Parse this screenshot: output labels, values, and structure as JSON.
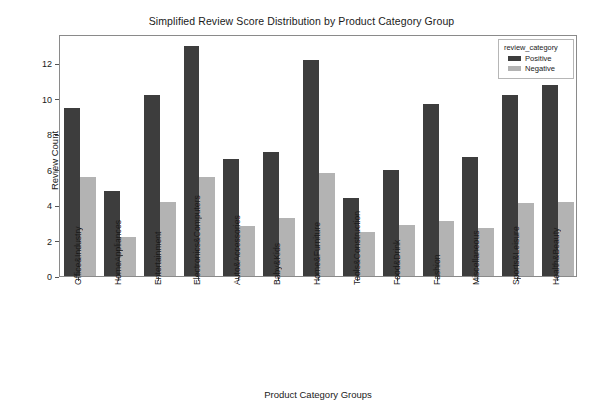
{
  "chart_data": {
    "type": "bar",
    "title": "Simplified Review Score Distribution by Product Category Group",
    "xlabel": "Product Category Groups",
    "ylabel": "Review Count",
    "categories": [
      "Office&Industry",
      "HomeAppliances",
      "Entertainment",
      "Electronics&Computers",
      "Auto&Accessories",
      "Baby&Kids",
      "Home&Furniture",
      "Tools&Construction",
      "Food&Drink",
      "Fashion",
      "Miscellaneous",
      "Sports&Leisure",
      "Health&Beauty"
    ],
    "series": [
      {
        "name": "Positive",
        "color": "#3d3d3d",
        "values": [
          9.5,
          4.8,
          10.2,
          13.0,
          6.6,
          7.0,
          12.2,
          4.4,
          6.0,
          9.7,
          6.7,
          10.2,
          10.8
        ]
      },
      {
        "name": "Negative",
        "color": "#b3b3b3",
        "values": [
          5.6,
          2.2,
          4.2,
          5.6,
          2.8,
          3.3,
          5.8,
          2.5,
          2.9,
          3.1,
          2.7,
          4.1,
          4.2
        ]
      }
    ],
    "ylim": [
      0,
      13.65
    ],
    "yticks": [
      0,
      2,
      4,
      6,
      8,
      10,
      12
    ],
    "ytick_labels": [
      "0",
      "2",
      "4",
      "6",
      "8",
      "10",
      "12"
    ],
    "grid": false,
    "legend": {
      "title": "review_category",
      "position": "upper right",
      "entries": [
        {
          "label": "Positive",
          "color": "#3d3d3d"
        },
        {
          "label": "Negative",
          "color": "#b3b3b3"
        }
      ]
    }
  }
}
